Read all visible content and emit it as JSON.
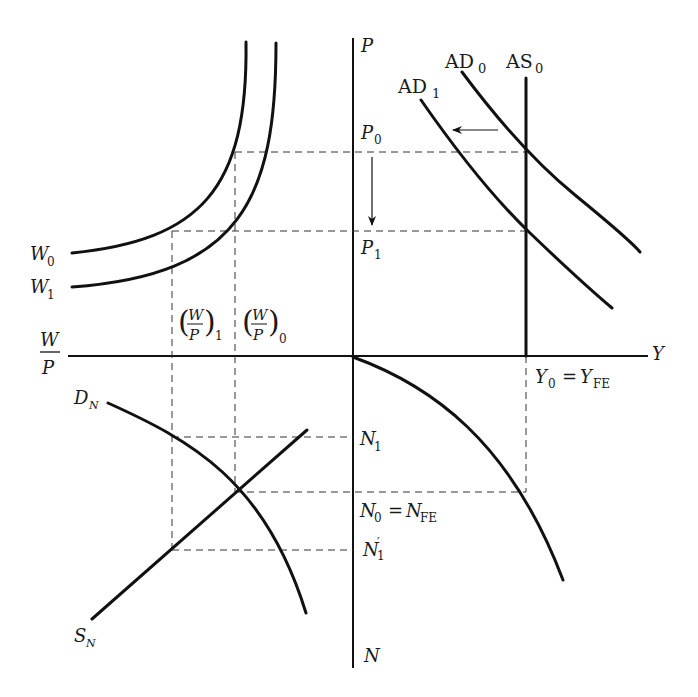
{
  "diagram": {
    "axes": {
      "vertical_top": "P",
      "vertical_bottom": "N",
      "horizontal_right": "Y",
      "horizontal_left_num": "W",
      "horizontal_left_den": "P"
    },
    "quadrant_ne": {
      "ad0": {
        "base": "AD",
        "sub": "0"
      },
      "ad1": {
        "base": "AD",
        "sub": "1"
      },
      "as0": {
        "base": "AS",
        "sub": "0"
      },
      "p0": {
        "base": "P",
        "sub": "0"
      },
      "p1": {
        "base": "P",
        "sub": "1"
      },
      "shift_arrow": "leftward shift of AD",
      "price_arrow": "price falls from P0 to P1"
    },
    "quadrant_nw": {
      "w0": {
        "base": "W",
        "sub": "0"
      },
      "w1": {
        "base": "W",
        "sub": "1"
      },
      "wp1": {
        "num": "W",
        "den": "P",
        "sub": "1"
      },
      "wp0": {
        "num": "W",
        "den": "P",
        "sub": "0"
      }
    },
    "quadrant_sw": {
      "dn": {
        "base": "D",
        "sub": "N"
      },
      "sn": {
        "base": "S",
        "sub": "N"
      }
    },
    "quadrant_se": {
      "y0": {
        "base": "Y",
        "sub": "0"
      },
      "eq": "=",
      "yfe": {
        "base": "Y",
        "sub": "FE"
      },
      "n1": {
        "base": "N",
        "sub": "1"
      },
      "n0": {
        "base": "N",
        "sub": "0"
      },
      "nfe": {
        "base": "N",
        "sub": "FE"
      },
      "n1p": {
        "base": "N",
        "prime": "′",
        "sub": "1"
      }
    }
  }
}
